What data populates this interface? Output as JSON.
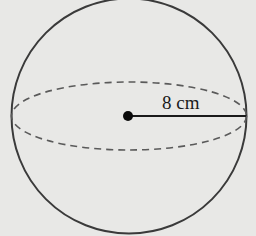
{
  "figure": {
    "shape": "sphere",
    "radius_label": "8 cm",
    "colors": {
      "background": "#e8e8e6",
      "outline": "#3a3a3a",
      "dashed_equator": "#5a5a5a",
      "radius_line": "#1a1a1a"
    }
  }
}
